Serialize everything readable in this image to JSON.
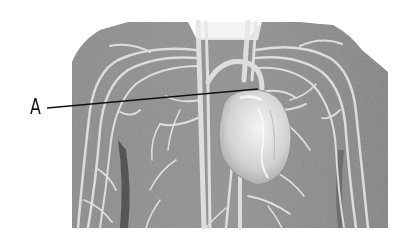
{
  "figure": {
    "style": "grayscale",
    "colors": {
      "background": "#ffffff",
      "torso": "#8a8a8a",
      "vessels": "#e4e4e4",
      "heart": "#d6d6d6",
      "leader_line": "#111111"
    }
  },
  "labels": [
    {
      "id": "A",
      "text": "A",
      "points_to": "upper region of heart (great vessel / atrium)"
    }
  ]
}
